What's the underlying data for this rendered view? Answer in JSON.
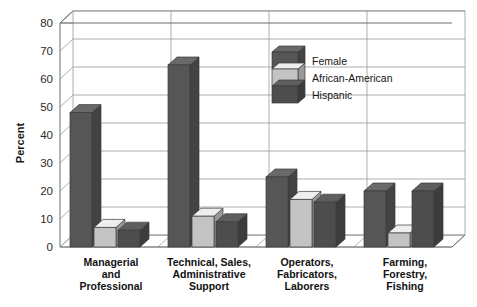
{
  "chart_data": {
    "type": "bar",
    "title": "",
    "subtitle": "",
    "xlabel": "",
    "ylabel": "Percent",
    "ylim": [
      0,
      80
    ],
    "ytick_step": 10,
    "yticks": [
      "0",
      "10",
      "20",
      "30",
      "40",
      "50",
      "60",
      "70",
      "80"
    ],
    "grid": true,
    "grid_axis": "y",
    "legend_position": "inside-top-center",
    "style": "3d-bars",
    "categories": [
      "Managerial and Professional",
      "Technical, Sales, Administrative Support",
      "Operators, Fabricators, Laborers",
      "Farming, Forestry, Fishing"
    ],
    "category_label_lines": [
      [
        "Managerial",
        "and",
        "Professional"
      ],
      [
        "Technical, Sales,",
        "Administrative",
        "Support"
      ],
      [
        "Operators,",
        "Fabricators,",
        "Laborers"
      ],
      [
        "Farming,",
        "Forestry,",
        "Fishing"
      ]
    ],
    "series": [
      {
        "name": "Female",
        "color": "#565656",
        "values": [
          48,
          65,
          25,
          20
        ]
      },
      {
        "name": "African-American",
        "color": "#c3c3c3",
        "values": [
          7,
          11,
          17,
          5
        ]
      },
      {
        "name": "Hispanic",
        "color": "#4d4d4d",
        "values": [
          6,
          9,
          16,
          20
        ]
      }
    ]
  },
  "colors": {
    "female": "#565656",
    "african_american": "#c3c3c3",
    "hispanic": "#4d4d4d",
    "plot_background": "#ffffff",
    "gridline": "#9a9a9a",
    "axis_line": "#6e6e6e",
    "text": "#121212"
  },
  "legend": {
    "items": [
      {
        "label": "Female",
        "color": "#565656"
      },
      {
        "label": "African-American",
        "color": "#c3c3c3"
      },
      {
        "label": "Hispanic",
        "color": "#4d4d4d"
      }
    ]
  },
  "axes": {
    "y_title": "Percent"
  }
}
